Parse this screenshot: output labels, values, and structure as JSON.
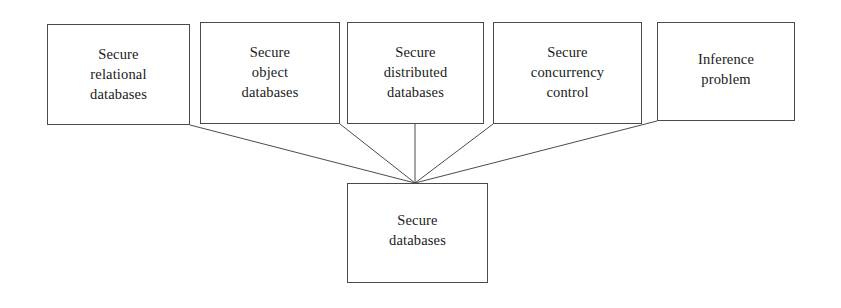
{
  "diagram": {
    "stroke_color": "#4a4a4a",
    "text_color": "#1a1a1a",
    "background_color": "#ffffff",
    "nodes": [
      {
        "id": "secure-relational-databases",
        "lines": [
          "Secure",
          "relational",
          "databases"
        ],
        "x": 47,
        "y": 24,
        "w": 143,
        "h": 101,
        "pad_top": 19
      },
      {
        "id": "secure-object-databases",
        "lines": [
          "Secure",
          "object",
          "databases"
        ],
        "x": 200,
        "y": 22,
        "w": 140,
        "h": 102,
        "pad_top": 19
      },
      {
        "id": "secure-distributed-databases",
        "lines": [
          "Secure",
          "distributed",
          "databases"
        ],
        "x": 347,
        "y": 22,
        "w": 137,
        "h": 102,
        "pad_top": 19
      },
      {
        "id": "secure-concurrency-control",
        "lines": [
          "Secure",
          "concurrency",
          "control"
        ],
        "x": 493,
        "y": 22,
        "w": 149,
        "h": 102,
        "pad_top": 19
      },
      {
        "id": "inference-problem",
        "lines": [
          "Inference",
          "problem"
        ],
        "x": 657,
        "y": 22,
        "w": 138,
        "h": 99,
        "pad_top": 26
      },
      {
        "id": "secure-databases",
        "lines": [
          "Secure",
          "databases"
        ],
        "x": 347,
        "y": 183,
        "w": 141,
        "h": 100,
        "pad_top": 26
      }
    ],
    "edges": [
      {
        "id": "edge-relational-to-root",
        "from": "secure-relational-databases",
        "to": "secure-databases",
        "x1": 190,
        "y1": 125,
        "x2": 415,
        "y2": 183
      },
      {
        "id": "edge-object-to-root",
        "from": "secure-object-databases",
        "to": "secure-databases",
        "x1": 340,
        "y1": 124,
        "x2": 415,
        "y2": 183
      },
      {
        "id": "edge-distributed-to-root",
        "from": "secure-distributed-databases",
        "to": "secure-databases",
        "x1": 415,
        "y1": 124,
        "x2": 415,
        "y2": 183
      },
      {
        "id": "edge-concurrency-to-root",
        "from": "secure-concurrency-control",
        "to": "secure-databases",
        "x1": 493,
        "y1": 124,
        "x2": 415,
        "y2": 183
      },
      {
        "id": "edge-inference-to-root",
        "from": "inference-problem",
        "to": "secure-databases",
        "x1": 657,
        "y1": 121,
        "x2": 415,
        "y2": 183
      }
    ]
  }
}
